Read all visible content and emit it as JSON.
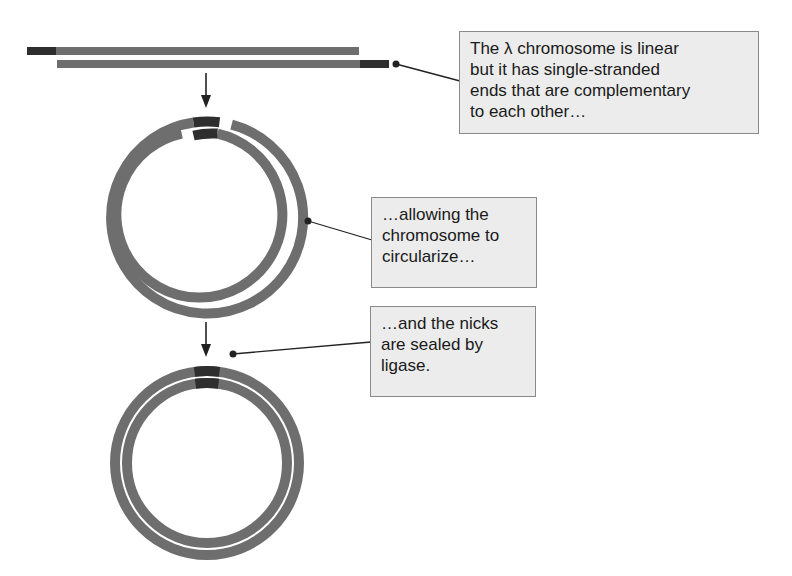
{
  "diagram": {
    "colors": {
      "strand": "#6e6e6e",
      "cohesive_end": "#2e2e2e",
      "callout_fill": "#ececec",
      "callout_border": "#8a8a8a",
      "leader_line": "#222222"
    },
    "stages": [
      {
        "id": "linear",
        "label": "linear double-stranded chromosome with single-stranded complementary ends"
      },
      {
        "id": "circular-nicked",
        "label": "circularized chromosome with nicks"
      },
      {
        "id": "circular-sealed",
        "label": "covalently closed circular chromosome"
      }
    ],
    "callouts": [
      {
        "id": "callout-1",
        "lines": [
          "The λ chromosome is linear",
          "but it has single-stranded",
          "ends that are complementary",
          "to each other…"
        ]
      },
      {
        "id": "callout-2",
        "lines": [
          "…allowing the",
          "chromosome to",
          "circularize…"
        ]
      },
      {
        "id": "callout-3",
        "lines": [
          "…and the nicks",
          "are sealed by",
          "ligase."
        ]
      }
    ]
  }
}
